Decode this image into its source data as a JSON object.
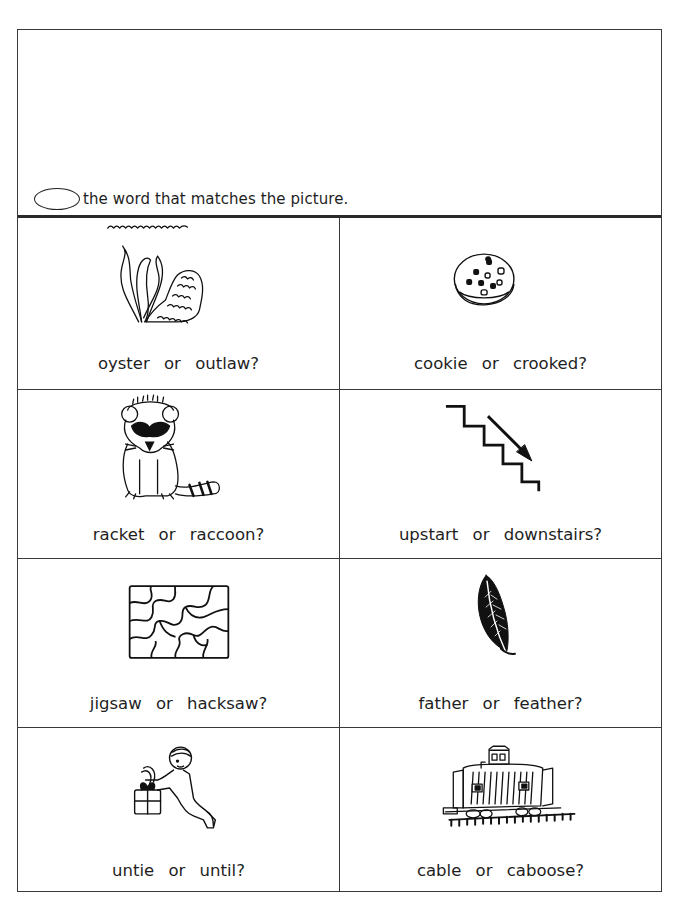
{
  "instruction": {
    "oval_icon": "circle-answer-oval-icon",
    "text": "the word that matches the picture."
  },
  "items": [
    {
      "picture": "oyster-icon",
      "option_a": "oyster",
      "connector": "or",
      "option_b": "outlaw?",
      "question": "oyster or outlaw?"
    },
    {
      "picture": "cookie-icon",
      "option_a": "cookie",
      "connector": "or",
      "option_b": "crooked?",
      "question": "cookie or crooked?"
    },
    {
      "picture": "raccoon-icon",
      "option_a": "racket",
      "connector": "or",
      "option_b": "raccoon?",
      "question": "racket or raccoon?"
    },
    {
      "picture": "downstairs-icon",
      "option_a": "upstart",
      "connector": "or",
      "option_b": "downstairs?",
      "question": "upstart or downstairs?"
    },
    {
      "picture": "jigsaw-puzzle-icon",
      "option_a": "jigsaw",
      "connector": "or",
      "option_b": "hacksaw?",
      "question": "jigsaw or hacksaw?"
    },
    {
      "picture": "feather-icon",
      "option_a": "father",
      "connector": "or",
      "option_b": "feather?",
      "question": "father or feather?"
    },
    {
      "picture": "untie-gift-icon",
      "option_a": "untie",
      "connector": "or",
      "option_b": "until?",
      "question": "untie or until?"
    },
    {
      "picture": "caboose-icon",
      "option_a": "cable",
      "connector": "or",
      "option_b": "caboose?",
      "question": "cable or caboose?"
    }
  ]
}
